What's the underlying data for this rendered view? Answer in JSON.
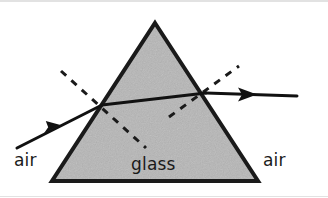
{
  "figure": {
    "type": "physics-optics-diagram",
    "canvas": {
      "width": 328,
      "height": 198,
      "background": "#ffffff"
    }
  },
  "labels": {
    "air_left": "air",
    "glass": "glass",
    "air_right": "air"
  },
  "label_positions": {
    "air_left": {
      "x": 14,
      "y": 166
    },
    "glass": {
      "x": 131,
      "y": 170
    },
    "air_right": {
      "x": 263,
      "y": 166
    }
  },
  "colors": {
    "prism_fill": "#b6b6b6",
    "prism_stroke": "#1a1a1a",
    "ray_stroke": "#111111",
    "normal_stroke": "#1a1a1a",
    "label_text": "#1a1a1a",
    "background": "#ffffff",
    "edge_rule": "#cfcfcf"
  },
  "geometry": {
    "prism": {
      "name": "glass-prism",
      "apex": {
        "x": 155,
        "y": 23
      },
      "bottom_left": {
        "x": 52,
        "y": 181
      },
      "bottom_right": {
        "x": 258,
        "y": 181
      },
      "points": "155,23 258,181 52,181",
      "stroke_width": 4
    },
    "incident_ray": {
      "name": "incident-ray",
      "start": {
        "x": 17,
        "y": 148
      },
      "end": {
        "x": 102,
        "y": 105
      },
      "arrow_at": {
        "x": 56,
        "y": 126
      },
      "stroke_width": 3
    },
    "internal_ray": {
      "name": "internal-ray",
      "start": {
        "x": 102,
        "y": 105
      },
      "end": {
        "x": 206,
        "y": 93
      },
      "stroke_width": 3
    },
    "refracted_ray": {
      "name": "refracted-ray",
      "start": {
        "x": 206,
        "y": 93
      },
      "end": {
        "x": 297,
        "y": 96
      },
      "arrow_at": {
        "x": 252,
        "y": 94
      },
      "stroke_width": 3
    },
    "entry_normal": {
      "name": "entry-normal-dashed",
      "start": {
        "x": 61,
        "y": 71
      },
      "end": {
        "x": 146,
        "y": 148
      },
      "stroke_width": 3,
      "dash": "7 7"
    },
    "exit_normal": {
      "name": "exit-normal-dashed",
      "start": {
        "x": 169,
        "y": 117
      },
      "end": {
        "x": 239,
        "y": 66
      },
      "stroke_width": 3,
      "dash": "7 7"
    },
    "entry_point": {
      "x": 102,
      "y": 105
    },
    "exit_point": {
      "x": 206,
      "y": 93
    }
  },
  "annotations": {
    "entry_point_name": "entry-refraction-point",
    "exit_point_name": "exit-refraction-point"
  }
}
